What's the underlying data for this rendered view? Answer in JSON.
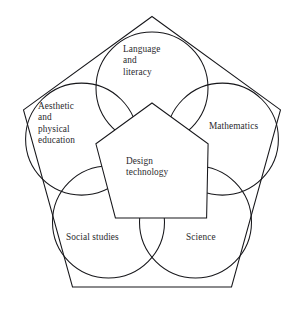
{
  "diagram": {
    "type": "venn-pentagon-curriculum-diagram",
    "center": {
      "name": "design-technology",
      "label": "Design\ntechnology",
      "shape": "pentagon"
    },
    "surrounding_areas": [
      {
        "name": "language-and-literacy",
        "label": "Language\nand\nliteracy",
        "shape": "circle",
        "position": "top"
      },
      {
        "name": "mathematics",
        "label": "Mathematics",
        "shape": "circle",
        "position": "right"
      },
      {
        "name": "science",
        "label": "Science",
        "shape": "circle",
        "position": "bottom-right"
      },
      {
        "name": "social-studies",
        "label": "Social studies",
        "shape": "circle",
        "position": "bottom-left"
      },
      {
        "name": "aesthetic-and-physical-education",
        "label": "Aesthetic\nand\nphysical\neducation",
        "shape": "circle",
        "position": "left"
      }
    ],
    "colors": {
      "stroke": "#16161a",
      "text": "#2a2a2e",
      "background": "#ffffff"
    }
  }
}
